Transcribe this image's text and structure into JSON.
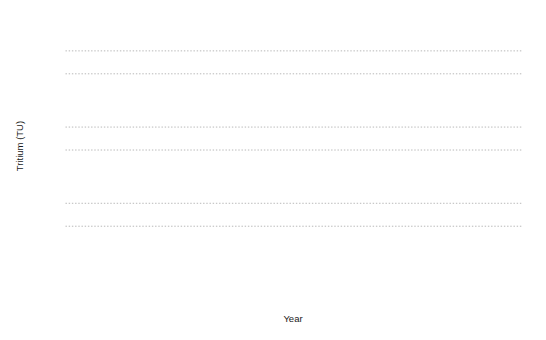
{
  "chart_data": {
    "type": "bar",
    "title": "",
    "xlabel": "Year",
    "ylabel": "Tritium (TU)",
    "yscale": "log",
    "ylim": [
      1,
      3000
    ],
    "xlim": [
      1950,
      1986
    ],
    "grid": true,
    "legend": null,
    "y_ticks": [
      1,
      5,
      10,
      50,
      100,
      500,
      1000
    ],
    "y_tick_labels": [
      "1",
      "5",
      "10",
      "50",
      "100",
      "500",
      "1000"
    ],
    "x_ticks": [
      1950,
      1960,
      1970,
      1980,
      1986
    ],
    "x_tick_labels": [
      "1950",
      "1960",
      "1970",
      "1980",
      "1986"
    ],
    "categories": [
      1950,
      1951,
      1952,
      1953,
      1954,
      1955,
      1956,
      1957,
      1958,
      1959,
      1960,
      1961,
      1962,
      1963,
      1964,
      1965,
      1966,
      1967,
      1968,
      1969,
      1970,
      1971,
      1972,
      1973,
      1974,
      1975,
      1976,
      1977,
      1978,
      1979,
      1980,
      1981,
      1982,
      1983,
      1984,
      1985,
      1986
    ],
    "values": [
      3,
      3,
      3,
      6,
      30,
      540,
      90,
      48,
      30,
      130,
      150,
      400,
      520,
      800,
      140,
      160,
      150,
      175,
      230,
      1050,
      820,
      2400,
      1900,
      1500,
      1200,
      1020,
      700,
      660,
      480,
      370,
      260,
      200,
      165,
      180,
      185,
      160,
      130
    ]
  },
  "series_values_by_year": {
    "1950": 3,
    "1951": 3,
    "1952": 3,
    "1953": 6,
    "1954": 30,
    "1955": 540,
    "1956": 90,
    "1957": 48,
    "1958": 30,
    "1959": 130,
    "1960": 150,
    "1961": 400,
    "1962": 520,
    "1963": 800,
    "1964": 140,
    "1965": 160,
    "1966": 150,
    "1967": 175,
    "1968": 230,
    "1969": 1050,
    "1970": 820,
    "1971": 2400,
    "1972": 1900,
    "1973": 1500,
    "1974": 1200,
    "1975": 1020,
    "1976": 700,
    "1977": 660,
    "1978": 480,
    "1979": 370,
    "1980": 260,
    "1981": 200,
    "1982": 165,
    "1983": 180,
    "1984": 185,
    "1985": 160,
    "1986": 130
  },
  "bars": [
    {
      "year": 1950,
      "value": 3
    },
    {
      "year": 1951,
      "value": 3
    },
    {
      "year": 1952,
      "value": 3
    },
    {
      "year": 1953,
      "value": 6
    },
    {
      "year": 1954,
      "value": 30
    },
    {
      "year": 1955,
      "value": 540
    },
    {
      "year": 1956,
      "value": 90
    },
    {
      "year": 1957,
      "value": 48
    },
    {
      "year": 1958,
      "value": 30
    },
    {
      "year": 1959,
      "value": 130
    },
    {
      "year": 1960,
      "value": 150
    },
    {
      "year": 1961,
      "value": 400
    },
    {
      "year": 1962,
      "value": 520
    },
    {
      "year": 1963,
      "value": 800
    },
    {
      "year": 1964,
      "value": 140
    },
    {
      "year": 1965,
      "value": 160
    },
    {
      "year": 1966,
      "value": 150
    },
    {
      "year": 1967,
      "value": 175
    },
    {
      "year": 1968,
      "value": 230
    },
    {
      "year": 1969,
      "value": 1050
    },
    {
      "year": 1970,
      "value": 820
    },
    {
      "year": 1971,
      "value": 2400
    },
    {
      "year": 1972,
      "value": 1900
    },
    {
      "year": 1973,
      "value": 1500
    },
    {
      "year": 1974,
      "value": 1200
    },
    {
      "year": 1975,
      "value": 1020
    },
    {
      "year": 1976,
      "value": 700
    },
    {
      "year": 1977,
      "value": 660
    },
    {
      "year": 1978,
      "value": 480
    },
    {
      "year": 1979,
      "value": 370
    },
    {
      "year": 1980,
      "value": 260
    },
    {
      "year": 1981,
      "value": 200
    },
    {
      "year": 1982,
      "value": 165
    },
    {
      "year": 1983,
      "value": 180
    },
    {
      "year": 1984,
      "value": 185
    },
    {
      "year": 1985,
      "value": 160
    },
    {
      "year": 1986,
      "value": 130
    }
  ],
  "colors": {
    "bar_fill": "#ffffff",
    "bar_stroke": "#6e6e6e",
    "axis": "#4a4a4a",
    "grid": "#9a9a9a",
    "text": "#1a1a1a",
    "background": "#ffffff"
  },
  "labels": {
    "y_axis_title": "Tritium (TU)",
    "x_axis_title": "Year"
  }
}
